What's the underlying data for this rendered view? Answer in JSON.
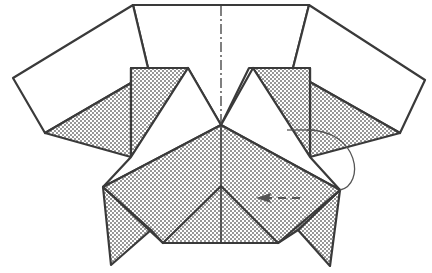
{
  "diagram": {
    "type": "origami-fold-step",
    "colors": {
      "line": "#3a3a3a",
      "paper_white": "#ffffff",
      "shade_dots": "#6b6b6b"
    },
    "symbols": [
      {
        "name": "center-line",
        "style": "dash-dot",
        "meaning": "mountain/valley crease along center"
      },
      {
        "name": "fold-arrow",
        "style": "curved arrow with dashed tail",
        "meaning": "fold flap toward center"
      }
    ],
    "regions": [
      {
        "name": "top-panel",
        "fill": "white"
      },
      {
        "name": "left-wing",
        "fill": "white"
      },
      {
        "name": "right-wing",
        "fill": "white"
      },
      {
        "name": "left-upper-flap",
        "fill": "shaded"
      },
      {
        "name": "right-upper-flap",
        "fill": "shaded"
      },
      {
        "name": "center-roof",
        "fill": "shaded"
      },
      {
        "name": "bottom-center-triangle",
        "fill": "shaded"
      },
      {
        "name": "left-bottom-point",
        "fill": "shaded"
      },
      {
        "name": "right-bottom-point",
        "fill": "shaded"
      }
    ]
  }
}
